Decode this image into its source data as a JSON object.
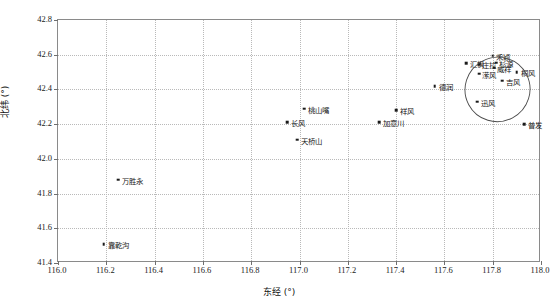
{
  "chart_data": {
    "type": "scatter",
    "title": "",
    "xlabel": "东经 (°)",
    "ylabel": "北纬 (°)",
    "xlim": [
      116.0,
      118.0
    ],
    "ylim": [
      41.4,
      42.8
    ],
    "xticks": [
      "116.0",
      "116.2",
      "116.4",
      "116.6",
      "116.8",
      "117.0",
      "117.2",
      "117.4",
      "117.6",
      "117.8",
      "118.0"
    ],
    "yticks": [
      "41.4",
      "41.6",
      "41.8",
      "42.0",
      "42.2",
      "42.4",
      "42.6",
      "42.8"
    ],
    "xtick_values": [
      116.0,
      116.2,
      116.4,
      116.6,
      116.8,
      117.0,
      117.2,
      117.4,
      117.6,
      117.8,
      118.0
    ],
    "ytick_values": [
      41.4,
      41.6,
      41.8,
      42.0,
      42.2,
      42.4,
      42.6,
      42.8
    ],
    "grid": true,
    "legend": "none",
    "marker_color": "#1a1a1a",
    "grid_color": "#b9b9b9",
    "frame_color": "#8a8a8a",
    "points": [
      {
        "label": "桃山嘴",
        "x": 117.02,
        "y": 42.29,
        "label_dx": 4,
        "label_dy": 0
      },
      {
        "label": "长风",
        "x": 116.95,
        "y": 42.21,
        "label_dx": 4,
        "label_dy": 0
      },
      {
        "label": "天桥山",
        "x": 116.99,
        "y": 42.11,
        "label_dx": 4,
        "label_dy": 0
      },
      {
        "label": "祥风",
        "x": 117.4,
        "y": 42.28,
        "label_dx": 4,
        "label_dy": 0
      },
      {
        "label": "加意川",
        "x": 117.33,
        "y": 42.21,
        "label_dx": 4,
        "label_dy": 0
      },
      {
        "label": "德润",
        "x": 117.56,
        "y": 42.42,
        "label_dx": 4,
        "label_dy": 0
      },
      {
        "label": "万胜永",
        "x": 116.25,
        "y": 41.88,
        "label_dx": 4,
        "label_dy": 0
      },
      {
        "label": "靠乾沟",
        "x": 116.19,
        "y": 41.51,
        "label_dx": 4,
        "label_dy": 0
      },
      {
        "label": "汇枫",
        "x": 117.69,
        "y": 42.55,
        "label_dx": 4,
        "label_dy": 0
      },
      {
        "label": "庄拉",
        "x": 117.745,
        "y": 42.545,
        "label_dx": 3,
        "label_dy": 0
      },
      {
        "label": "禾颖",
        "x": 117.8,
        "y": 42.595,
        "label_dx": 3,
        "label_dy": 0
      },
      {
        "label": "杉源",
        "x": 117.815,
        "y": 42.555,
        "label_dx": 3,
        "label_dy": 0
      },
      {
        "label": "威祥",
        "x": 117.805,
        "y": 42.525,
        "label_dx": 3,
        "label_dy": 0
      },
      {
        "label": "潆风",
        "x": 117.745,
        "y": 42.49,
        "label_dx": 3,
        "label_dy": 0
      },
      {
        "label": "桐风",
        "x": 117.9,
        "y": 42.5,
        "label_dx": 4,
        "label_dy": 0
      },
      {
        "label": "吉风",
        "x": 117.84,
        "y": 42.45,
        "label_dx": 4,
        "label_dy": 0
      },
      {
        "label": "迅风",
        "x": 117.735,
        "y": 42.33,
        "label_dx": 4,
        "label_dy": 0
      },
      {
        "label": "普发",
        "x": 117.93,
        "y": 42.2,
        "label_dx": 4,
        "label_dy": 0
      }
    ],
    "annotations": [
      {
        "type": "ellipse",
        "name": "cluster-ellipse",
        "cx": 117.82,
        "cy": 42.4,
        "rx": 0.135,
        "ry": 0.185,
        "rotation_deg": -28,
        "stroke": "#4a4a4a"
      }
    ]
  }
}
